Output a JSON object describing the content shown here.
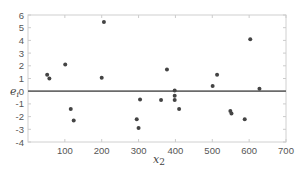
{
  "chart_data": {
    "type": "scatter",
    "title": "",
    "xlabel": "x2",
    "ylabel": "e_i",
    "xlim": [
      0,
      700
    ],
    "ylim": [
      -4,
      6
    ],
    "xticks": [
      100,
      200,
      300,
      400,
      500,
      600,
      700
    ],
    "yticks": [
      -4,
      -3,
      -2,
      -1,
      0,
      1,
      2,
      3,
      4,
      5,
      6
    ],
    "grid": false,
    "reference_line": {
      "y": 0,
      "color": "#6b6b6b"
    },
    "marker_color": "#444444",
    "points": [
      {
        "x": 52,
        "y": 1.3
      },
      {
        "x": 58,
        "y": 1.0
      },
      {
        "x": 101,
        "y": 2.1
      },
      {
        "x": 116,
        "y": -1.4
      },
      {
        "x": 124,
        "y": -2.3
      },
      {
        "x": 200,
        "y": 1.05
      },
      {
        "x": 206,
        "y": 5.45
      },
      {
        "x": 295,
        "y": -2.2
      },
      {
        "x": 300,
        "y": -2.9
      },
      {
        "x": 304,
        "y": -0.65
      },
      {
        "x": 361,
        "y": -0.7
      },
      {
        "x": 377,
        "y": 1.7
      },
      {
        "x": 398,
        "y": 0.05
      },
      {
        "x": 398,
        "y": -0.35
      },
      {
        "x": 398,
        "y": -0.7
      },
      {
        "x": 410,
        "y": -1.4
      },
      {
        "x": 501,
        "y": 0.4
      },
      {
        "x": 513,
        "y": 1.3
      },
      {
        "x": 549,
        "y": -1.55
      },
      {
        "x": 552,
        "y": -1.75
      },
      {
        "x": 588,
        "y": -2.2
      },
      {
        "x": 603,
        "y": 4.1
      },
      {
        "x": 628,
        "y": 0.2
      }
    ]
  },
  "labels": {
    "xlabel_main": "x",
    "xlabel_sub": "2",
    "ylabel_main": "e",
    "ylabel_sub": "i"
  }
}
